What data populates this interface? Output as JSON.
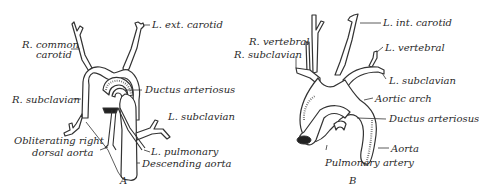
{
  "figure_a": {
    "caption": "A",
    "labels": {
      "l_ext_carotid": "L. ext. carotid",
      "r_common_carotid_line1": "R. common",
      "r_common_carotid_line2": "carotid",
      "ductus_arteriosus": "Ductus arteriosus",
      "r_subclavian": "R. subclavian",
      "l_subclavian": "L. subclavian",
      "obliterating_line1": "Obliterating right",
      "obliterating_line2": "dorsal aorta",
      "l_pulmonary": "L. pulmonary",
      "descending_aorta": "Descending aorta"
    }
  },
  "figure_b": {
    "caption": "B",
    "labels": {
      "l_int_carotid": "L. int. carotid",
      "r_vertebral": "R. vertebral",
      "r_subclavian": "R. subclavian",
      "l_vertebral": "L. vertebral",
      "l_subclavian": "L. subclavian",
      "aortic_arch": "Aortic arch",
      "ductus_arteriosus": "Ductus arteriosus",
      "aorta": "Aorta",
      "pulmonary_artery": "Pulmonary artery"
    }
  }
}
